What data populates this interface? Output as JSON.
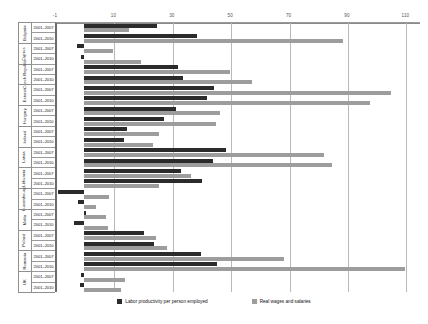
{
  "chart_data": {
    "type": "bar",
    "orientation": "horizontal",
    "title": "",
    "xlabel": "",
    "ylabel": "",
    "xlim": [
      -10,
      115
    ],
    "xticks": [
      -10,
      10,
      30,
      50,
      70,
      90,
      110
    ],
    "xticklabels": [
      "-1",
      "10",
      "30",
      "50",
      "70",
      "90",
      "110"
    ],
    "grid": true,
    "legend_position": "bottom",
    "legend": [
      "Labor productivity per person employed",
      "Real wages and salaries"
    ],
    "series_colors": {
      "labor_productivity": "#2b2b2b",
      "real_wages": "#9d9d9d"
    },
    "series": [
      {
        "name": "Labor productivity per person employed",
        "values": [
          25.0,
          38.5,
          -2.5,
          -1.0,
          32.0,
          34.0,
          44.5,
          42.0,
          31.5,
          27.5,
          14.5,
          13.5,
          48.5,
          44.0,
          33.0,
          40.5,
          28.5,
          30.5,
          -9.0,
          -2.0,
          0.5,
          -3.5,
          20.5,
          24.0,
          40.0,
          45.5,
          -1.0,
          -1.5
        ]
      },
      {
        "name": "Real wages and salaries",
        "values": [
          15.5,
          88.5,
          10.0,
          19.5,
          50.0,
          57.5,
          105.0,
          98.0,
          46.5,
          45.0,
          25.5,
          23.5,
          82.0,
          85.0,
          36.5,
          25.5,
          8.5,
          4.0,
          0.5,
          8.0,
          7.5,
          8.0,
          24.5,
          28.5,
          68.5,
          110.0,
          14.0,
          12.5
        ]
      }
    ],
    "groups": [
      {
        "country": "Bulgaria",
        "rows": [
          {
            "period": "2001–2007",
            "labor_productivity": 25.0,
            "real_wages": 15.5
          },
          {
            "period": "2001–2010",
            "labor_productivity": 38.5,
            "real_wages": 88.5
          }
        ]
      },
      {
        "country": "Cyprus",
        "rows": [
          {
            "period": "2001–2007",
            "labor_productivity": -2.5,
            "real_wages": 10.0
          },
          {
            "period": "2001–2010",
            "labor_productivity": -1.0,
            "real_wages": 19.5
          }
        ]
      },
      {
        "country": "Czech Republic",
        "rows": [
          {
            "period": "2001–2007",
            "labor_productivity": 32.0,
            "real_wages": 50.0
          },
          {
            "period": "2001–2010",
            "labor_productivity": 34.0,
            "real_wages": 57.5
          }
        ]
      },
      {
        "country": "Estonia",
        "rows": [
          {
            "period": "2001–2007",
            "labor_productivity": 44.5,
            "real_wages": 105.0
          },
          {
            "period": "2001–2010",
            "labor_productivity": 42.0,
            "real_wages": 98.0
          }
        ]
      },
      {
        "country": "Hungary",
        "rows": [
          {
            "period": "2001–2007",
            "labor_productivity": 31.5,
            "real_wages": 46.5
          },
          {
            "period": "2001–2010",
            "labor_productivity": 27.5,
            "real_wages": 45.0
          }
        ]
      },
      {
        "country": "Ireland",
        "rows": [
          {
            "period": "2001–2007",
            "labor_productivity": 14.5,
            "real_wages": 25.5
          },
          {
            "period": "2001–2010",
            "labor_productivity": 13.5,
            "real_wages": 23.5
          }
        ]
      },
      {
        "country": "Latvia",
        "rows": [
          {
            "period": "2001–2007",
            "labor_productivity": 48.5,
            "real_wages": 82.0
          },
          {
            "period": "2001–2010",
            "labor_productivity": 44.0,
            "real_wages": 85.0
          }
        ]
      },
      {
        "country": "Lithuania",
        "rows": [
          {
            "period": "2001–2007",
            "labor_productivity": 33.0,
            "real_wages": 36.5
          },
          {
            "period": "2001–2010",
            "labor_productivity": 40.5,
            "real_wages": 25.5
          }
        ]
      },
      {
        "country": "Luxembourg",
        "rows": [
          {
            "period": "2001–2007",
            "labor_productivity": -9.0,
            "real_wages": 8.5
          },
          {
            "period": "2001–2010",
            "labor_productivity": -2.0,
            "real_wages": 4.0
          }
        ]
      },
      {
        "country": "Malta",
        "rows": [
          {
            "period": "2001–2007",
            "labor_productivity": 0.5,
            "real_wages": 7.5
          },
          {
            "period": "2001–2010",
            "labor_productivity": -3.5,
            "real_wages": 8.0
          }
        ]
      },
      {
        "country": "Poland",
        "rows": [
          {
            "period": "2001–2007",
            "labor_productivity": 20.5,
            "real_wages": 24.5
          },
          {
            "period": "2001–2010",
            "labor_productivity": 24.0,
            "real_wages": 28.5
          }
        ]
      },
      {
        "country": "Romania",
        "rows": [
          {
            "period": "2001–2007",
            "labor_productivity": 40.0,
            "real_wages": 68.5
          },
          {
            "period": "2001–2010",
            "labor_productivity": 45.5,
            "real_wages": 110.0
          }
        ]
      },
      {
        "country": "UK",
        "rows": [
          {
            "period": "2001–2007",
            "labor_productivity": -1.0,
            "real_wages": 14.0
          },
          {
            "period": "2001–2010",
            "labor_productivity": -1.5,
            "real_wages": 12.5
          }
        ]
      }
    ]
  }
}
